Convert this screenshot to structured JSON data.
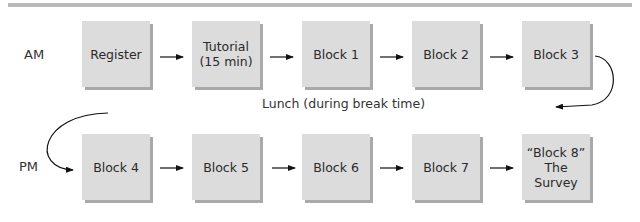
{
  "diagram": {
    "lunch_label": "Lunch (during break time)",
    "rows": [
      {
        "label": "AM",
        "blocks": [
          "Register",
          "Tutorial\n(15 min)",
          "Block 1",
          "Block 2",
          "Block 3"
        ]
      },
      {
        "label": "PM",
        "blocks": [
          "Block 4",
          "Block 5",
          "Block 6",
          "Block 7",
          "“Block 8”\nThe Survey"
        ]
      }
    ],
    "colors": {
      "box_fill": "#dcdcdc",
      "box_shadow": "#a9a9a9",
      "rule": "#b9b9b9",
      "arrow": "#111111"
    }
  }
}
